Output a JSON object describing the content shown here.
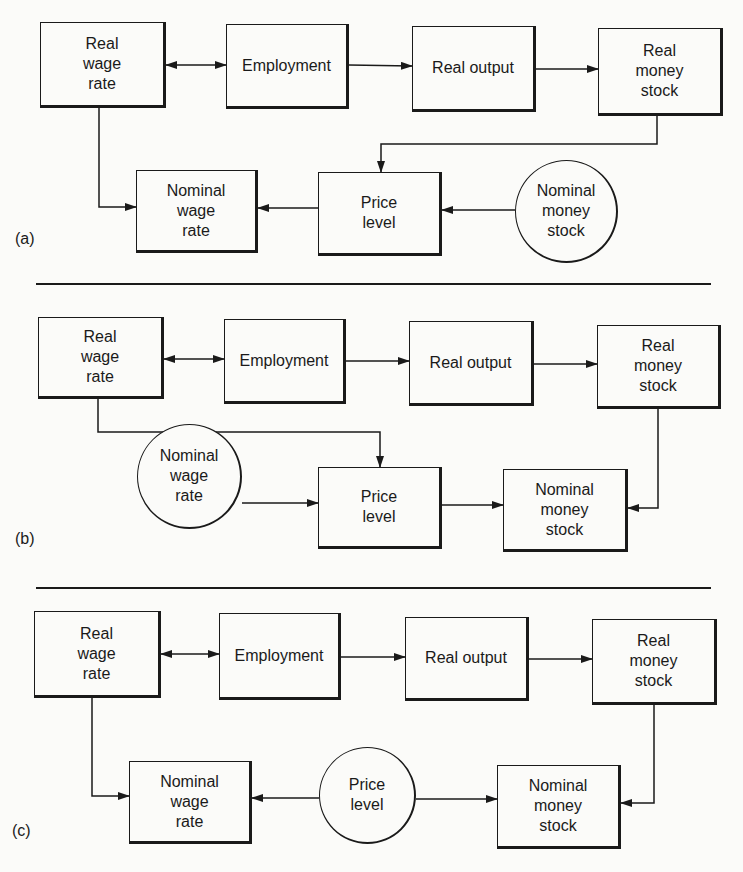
{
  "panels": [
    {
      "label": "(a)",
      "nodes": {
        "real_wage_rate": "Real\nwage\nrate",
        "employment": "Employment",
        "real_output": "Real output",
        "real_money_stock": "Real\nmoney\nstock",
        "nominal_wage_rate": "Nominal\nwage\nrate",
        "price_level": "Price\nlevel",
        "nominal_money_stock": "Nominal\nmoney\nstock"
      },
      "exogenous": "nominal_money_stock"
    },
    {
      "label": "(b)",
      "nodes": {
        "real_wage_rate": "Real\nwage\nrate",
        "employment": "Employment",
        "real_output": "Real output",
        "real_money_stock": "Real\nmoney\nstock",
        "nominal_wage_rate": "Nominal\nwage\nrate",
        "price_level": "Price\nlevel",
        "nominal_money_stock": "Nominal\nmoney\nstock"
      },
      "exogenous": "nominal_wage_rate"
    },
    {
      "label": "(c)",
      "nodes": {
        "real_wage_rate": "Real\nwage\nrate",
        "employment": "Employment",
        "real_output": "Real output",
        "real_money_stock": "Real\nmoney\nstock",
        "nominal_wage_rate": "Nominal\nwage\nrate",
        "price_level": "Price\nlevel",
        "nominal_money_stock": "Nominal\nmoney\nstock"
      },
      "exogenous": "price_level"
    }
  ],
  "colors": {
    "ink": "#1a1a1a",
    "paper": "#fbfbf9"
  }
}
